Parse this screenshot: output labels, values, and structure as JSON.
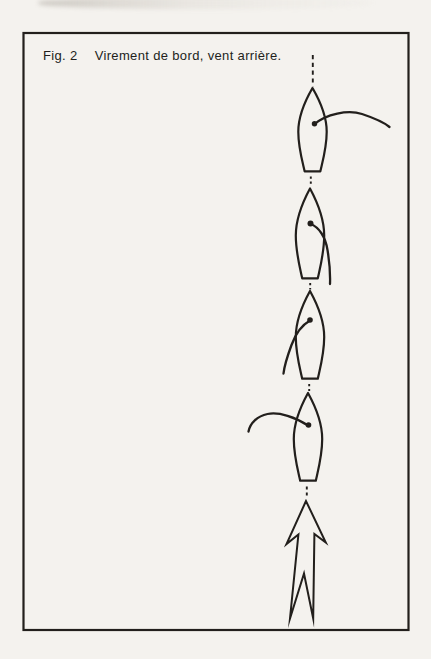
{
  "figure": {
    "label": "Fig. 2",
    "caption": "Virement de bord, vent arrière."
  },
  "colors": {
    "paper": "#f4f2ee",
    "ink": "#221f1c"
  },
  "diagram": {
    "type": "sailing-manoeuvre-sequence",
    "boat_count": 4,
    "boats": [
      {
        "id": "boat-1-top",
        "sail_position": "boom out to starboard (right)"
      },
      {
        "id": "boat-2",
        "sail_position": "boom trailing aft to starboard"
      },
      {
        "id": "boat-3",
        "sail_position": "boom trailing aft to port"
      },
      {
        "id": "boat-4-bottom",
        "sail_position": "boom out to port (left)"
      }
    ],
    "wind_arrow": "large outlined arrow from astern pointing up along the dashed course line"
  }
}
